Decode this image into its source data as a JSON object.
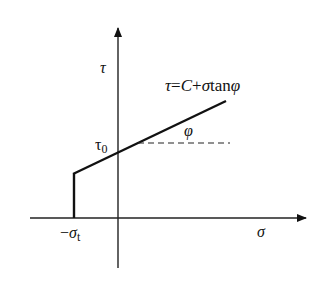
{
  "diagram": {
    "type": "Mohr-Coulomb strength envelope with tension cut-off",
    "axes": {
      "x_label": "σ",
      "y_label": "τ"
    },
    "equation": {
      "lhs": "τ",
      "eq": "=",
      "c": "C",
      "plus": "+",
      "sigma": "σ",
      "tan": "tan",
      "phi": "φ"
    },
    "labels": {
      "intercept_main": "τ",
      "intercept_sub": "0",
      "angle": "φ",
      "tension_minus": "−",
      "tension_sigma": "σ",
      "tension_sub": "t"
    },
    "colors": {
      "line": "#111111",
      "axis": "#222222",
      "dash": "#222222"
    }
  }
}
